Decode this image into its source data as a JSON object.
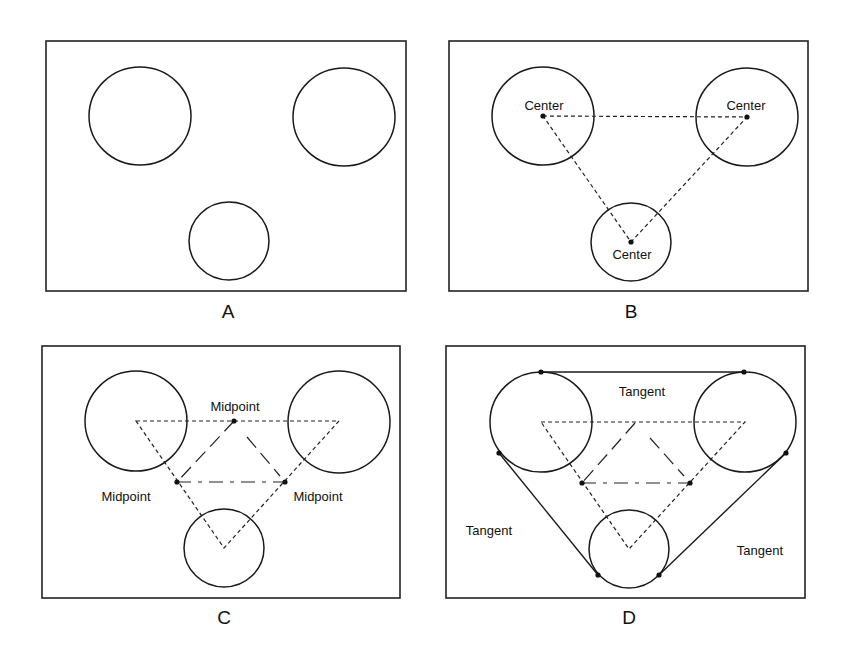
{
  "figure": {
    "panels": [
      {
        "id": "A",
        "label": "A",
        "description": "Three circles (two large top, one small bottom)",
        "annotations": []
      },
      {
        "id": "B",
        "label": "B",
        "description": "Centers of the circles connected by dashed triangle",
        "annotations": [
          "Center",
          "Center",
          "Center"
        ]
      },
      {
        "id": "C",
        "label": "C",
        "description": "Midpoints of triangle sides connected forming inner triangle",
        "annotations": [
          "Midpoint",
          "Midpoint",
          "Midpoint"
        ]
      },
      {
        "id": "D",
        "label": "D",
        "description": "External tangent lines drawn connecting the circles",
        "annotations": [
          "Tangent",
          "Tangent",
          "Tangent"
        ]
      }
    ]
  },
  "labels": {
    "panel_a": "A",
    "panel_b": "B",
    "panel_c": "C",
    "panel_d": "D",
    "b_center_left": "Center",
    "b_center_right": "Center",
    "b_center_bottom": "Center",
    "c_midpoint_top": "Midpoint",
    "c_midpoint_left": "Midpoint",
    "c_midpoint_right": "Midpoint",
    "d_tangent_top": "Tangent",
    "d_tangent_left": "Tangent",
    "d_tangent_right": "Tangent"
  }
}
